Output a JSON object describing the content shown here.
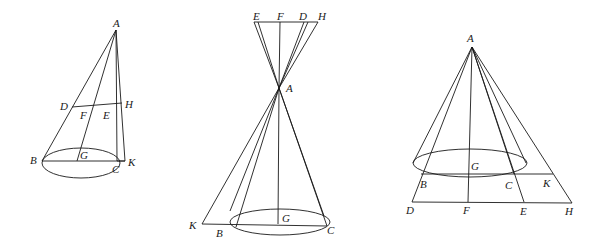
{
  "figures": [
    {
      "id": "fig1",
      "description": "Oblique cone with apex A, base circle through B and C with center G, section line DH through F and E, and line AK",
      "labels": {
        "A": "A",
        "D": "D",
        "F": "F",
        "E": "E",
        "H": "H",
        "B": "B",
        "G": "G",
        "C": "C",
        "K": "K"
      }
    },
    {
      "id": "fig2",
      "description": "Double cone with vertex A, upper line E F D H, lower base circle with center G through B and C, point K",
      "labels": {
        "E": "E",
        "F": "F",
        "D": "D",
        "H": "H",
        "A": "A",
        "K": "K",
        "B": "B",
        "G": "G",
        "C": "C"
      }
    },
    {
      "id": "fig3",
      "description": "Cone with apex A, base circle center G, line BK, and lower line D F E H",
      "labels": {
        "A": "A",
        "G": "G",
        "B": "B",
        "C": "C",
        "K": "K",
        "D": "D",
        "F": "F",
        "E": "E",
        "H": "H"
      }
    }
  ]
}
